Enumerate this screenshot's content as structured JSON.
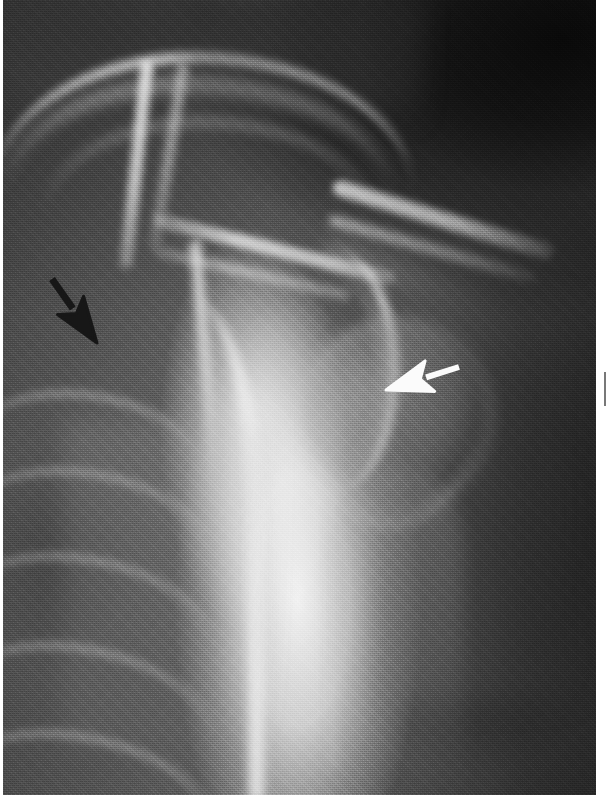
{
  "figure": {
    "kind": "radiograph",
    "modality": "X-ray",
    "view": "shoulder / clavicle anteroposterior (AP) projection",
    "width_px": 611,
    "height_px": 801,
    "background_color": "#ffffff"
  },
  "plate": {
    "left_px": 3,
    "top_px": 0,
    "width_px": 593,
    "height_px": 795,
    "base_color": "#6d6d6d",
    "tone_notes": "dark air/lung field upper-right and lower-left, bright bone and soft-tissue column through the centre, mid-gray deltoid soft tissue to the right",
    "grain": "fine halftone film grain from the scanned print"
  },
  "anatomy": [
    {
      "id": "clavicle",
      "label": "clavicle",
      "region": "long pale arc across the upper third"
    },
    {
      "id": "acromion",
      "label": "acromion / distal clavicle",
      "region": "sloping bar descending to the right, upper right quadrant"
    },
    {
      "id": "scapular-spine",
      "label": "scapular spine",
      "region": "oblique ridge through the mid-left"
    },
    {
      "id": "coracoid",
      "label": "coracoid process / first rib",
      "region": "vertical bright strut, centre-left"
    },
    {
      "id": "glenoid",
      "label": "glenoid / lateral scapular border",
      "region": "bright curve in the centre of the film"
    },
    {
      "id": "humeral-head",
      "label": "humeral head",
      "region": "rounded mass right of centre"
    },
    {
      "id": "humerus-shaft",
      "label": "proximal humeral shaft",
      "region": "descending column, lower centre-right"
    },
    {
      "id": "ribs",
      "label": "ribs",
      "region": "oblique arcs across the lower left"
    },
    {
      "id": "chest-wall",
      "label": "lateral chest wall",
      "region": "bright vertical border left of centre"
    }
  ],
  "annotations": {
    "arrows": [
      {
        "id": "black-arrow",
        "name": "black-annotation-arrow",
        "color": "#171717",
        "outline_color": "#f2f2f2",
        "direction": "down-right",
        "tail_x": 52,
        "tail_y": 279,
        "tip_x": 97,
        "tip_y": 343,
        "points_at": "medial structure in the left upper zone"
      },
      {
        "id": "white-arrow",
        "name": "white-annotation-arrow",
        "color": "#fbfbfb",
        "outline_color": "#3a3a3a",
        "direction": "left",
        "tail_x": 459,
        "tail_y": 367,
        "tip_x": 386,
        "tip_y": 390,
        "points_at": "lateral margin of the humeral head / glenohumeral region"
      }
    ]
  },
  "margins": {
    "left_px": 3,
    "right_px": 15,
    "bottom_px": 6,
    "color": "#ffffff",
    "edge_mark": {
      "present": true,
      "x_px": 604,
      "y_px": 372,
      "width_px": 2,
      "height_px": 34,
      "color": "#787878"
    }
  }
}
